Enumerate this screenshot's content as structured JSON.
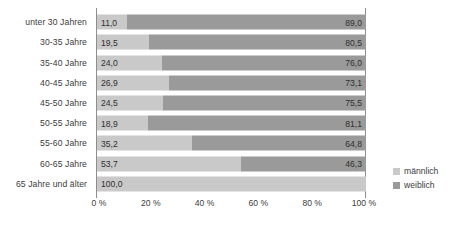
{
  "chart_data": {
    "type": "bar",
    "orientation": "horizontal",
    "stacked": true,
    "normalized_percent": true,
    "title": "",
    "subtitle": "",
    "xlabel": "",
    "ylabel": "",
    "xlim": [
      0,
      100
    ],
    "grid": true,
    "legend_position": "right",
    "categories": [
      "unter 30 Jahren",
      "30-35 Jahre",
      "35-40 Jahre",
      "40-45 Jahre",
      "45-50 Jahre",
      "50-55 Jahre",
      "55-60 Jahre",
      "60-65 Jahre",
      "65 Jahre und älter"
    ],
    "series": [
      {
        "name": "männlich",
        "color": "#c9c9c9",
        "values": [
          11.0,
          19.5,
          24.0,
          26.9,
          24.5,
          18.9,
          35.2,
          53.7,
          100.0
        ],
        "labels": [
          "11,0",
          "19,5",
          "24,0",
          "26,9",
          "24,5",
          "18,9",
          "35,2",
          "53,7",
          "100,0"
        ]
      },
      {
        "name": "weiblich",
        "color": "#9a9a9a",
        "values": [
          89.0,
          80.5,
          76.0,
          73.1,
          75.5,
          81.1,
          64.8,
          46.3,
          0.0
        ],
        "labels": [
          "89,0",
          "80,5",
          "76,0",
          "73,1",
          "75,5",
          "81,1",
          "64,8",
          "46,3",
          ""
        ]
      }
    ],
    "xticks": [
      0,
      20,
      40,
      60,
      80,
      100
    ],
    "xtick_labels": [
      "0 %",
      "20 %",
      "40 %",
      "60 %",
      "80 %",
      "100 %"
    ]
  },
  "legend": {
    "items": [
      {
        "label": "männlich",
        "color": "#c9c9c9"
      },
      {
        "label": "weiblich",
        "color": "#9a9a9a"
      }
    ]
  },
  "colors": {
    "male": "#c9c9c9",
    "female": "#9a9a9a",
    "axis": "#8e8e8e",
    "text": "#3b3b3b",
    "background": "#ffffff"
  }
}
